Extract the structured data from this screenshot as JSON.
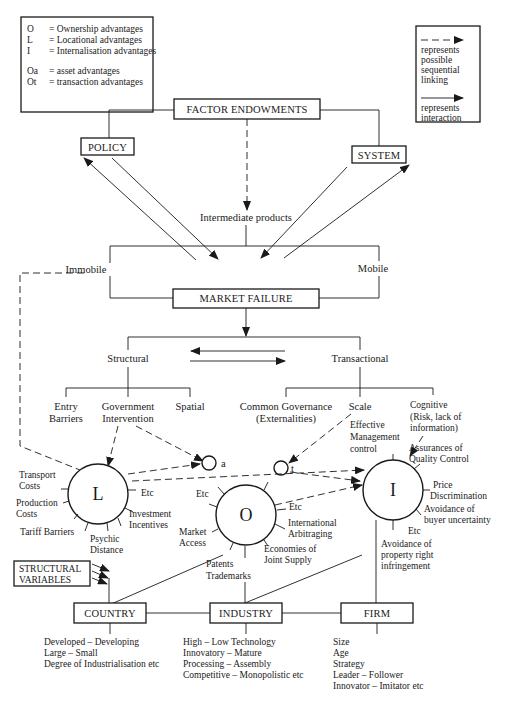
{
  "legend_left": {
    "items": [
      {
        "sym": "O",
        "def": "= Ownership advantages"
      },
      {
        "sym": "L",
        "def": "= Locational advantages"
      },
      {
        "sym": "I",
        "def": "= Internalisation advantages"
      },
      {
        "sym": "Oa",
        "def": "= asset advantages"
      },
      {
        "sym": "Ot",
        "def": "= transaction advantages"
      }
    ]
  },
  "legend_right": {
    "dashed": [
      "represents",
      "possible",
      "sequential",
      "linking"
    ],
    "solid": [
      "represents",
      "interaction"
    ]
  },
  "nodes": {
    "factor_endowments": "FACTOR ENDOWMENTS",
    "policy": "POLICY",
    "system": "SYSTEM",
    "intermediate_products": "Intermediate products",
    "immobile": "Immobile",
    "mobile": "Mobile",
    "market_failure": "MARKET FAILURE",
    "structural": "Structural",
    "transactional": "Transactional",
    "entry_barriers": [
      "Entry",
      "Barriers"
    ],
    "government_intervention": [
      "Government",
      "Intervention"
    ],
    "spatial": "Spatial",
    "common_governance": [
      "Common Governance",
      "(Externalities)"
    ],
    "scale": "Scale",
    "cognitive": [
      "Cognitive",
      "(Risk, lack of",
      "information)"
    ],
    "effective_management": [
      "Effective",
      "Management",
      "control"
    ],
    "oa_label": "a",
    "ot_label": "t",
    "circle_L": "L",
    "circle_O": "O",
    "circle_I": "I",
    "structural_variables": [
      "STRUCTURAL",
      "VARIABLES"
    ],
    "country": "COUNTRY",
    "industry": "INDUSTRY",
    "firm": "FIRM"
  },
  "L_spokes": {
    "transport_costs": [
      "Transport",
      "Costs"
    ],
    "production_costs": [
      "Production",
      "Costs"
    ],
    "tariff_barriers": "Tariff Barriers",
    "psychic_distance": [
      "Psychic",
      "Distance"
    ],
    "investment_incentives": [
      "Investment",
      "Incentives"
    ],
    "etc": "Etc"
  },
  "O_spokes": {
    "etc_left": "Etc",
    "market_access": [
      "Market",
      "Access"
    ],
    "patents_trademarks": [
      "Patents",
      "Trademarks"
    ],
    "economies_joint_supply": [
      "Economies of",
      "Joint Supply"
    ],
    "international_arbitraging": [
      "International",
      "Arbitraging"
    ],
    "etc_right": "Etc"
  },
  "I_spokes": {
    "assurances_quality": [
      "Assurances of",
      "Quality Control"
    ],
    "price_discrimination": [
      "Price",
      "Discrimination"
    ],
    "avoidance_buyer": [
      "Avoidance of",
      "buyer uncertainty"
    ],
    "etc": "Etc",
    "avoidance_property": [
      "Avoidance of",
      "property right",
      "infringement"
    ]
  },
  "country_attrs": [
    "Developed – Developing",
    "Large – Small",
    "Degree of Industrialisation etc"
  ],
  "industry_attrs": [
    "High – Low Technology",
    "Innovatory – Mature",
    "Processing – Assembly",
    "Competitive – Monopolistic etc"
  ],
  "firm_attrs": [
    "Size",
    "Age",
    "Strategy",
    "Leader – Follower",
    "Innovator – Imitator etc"
  ]
}
